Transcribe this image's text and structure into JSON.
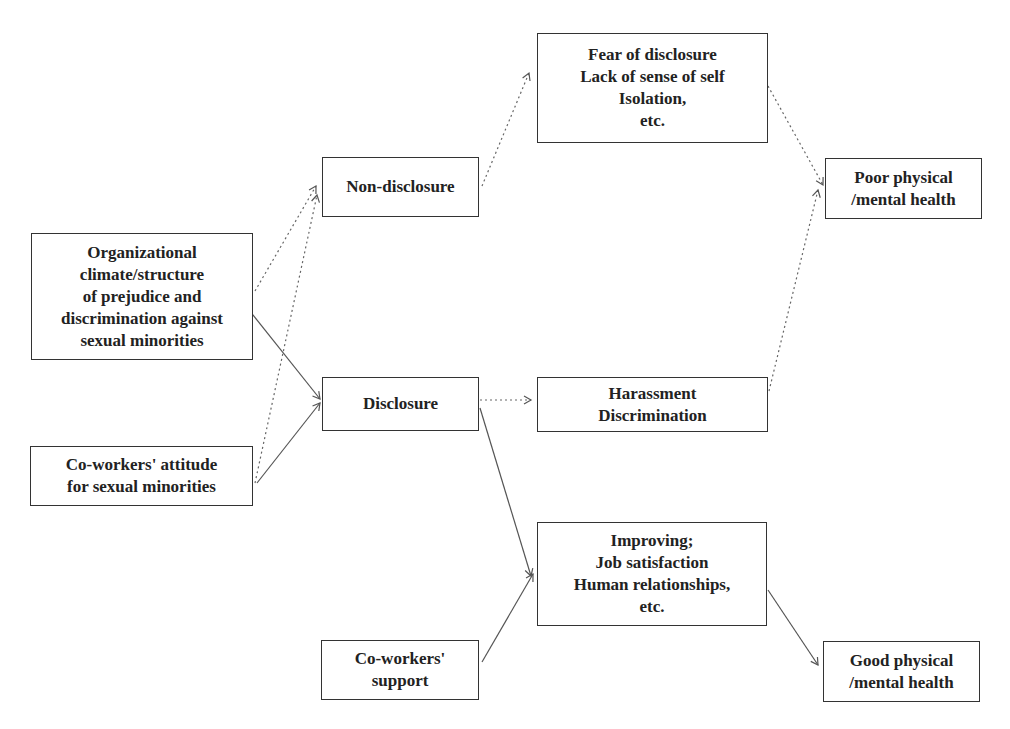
{
  "diagram": {
    "nodes": {
      "org_climate": {
        "lines": [
          "Organizational",
          "climate/structure",
          "of prejudice and",
          "discrimination against",
          "sexual minorities"
        ]
      },
      "coworkers_attitude": {
        "lines": [
          "Co-workers' attitude",
          "for sexual minorities"
        ]
      },
      "non_disclosure": {
        "lines": [
          "Non-disclosure"
        ]
      },
      "disclosure": {
        "lines": [
          "Disclosure"
        ]
      },
      "coworkers_support": {
        "lines": [
          "Co-workers'",
          "support"
        ]
      },
      "fear": {
        "lines": [
          "Fear of disclosure",
          "Lack of sense of self",
          "Isolation,",
          "etc."
        ]
      },
      "harassment": {
        "lines": [
          "Harassment",
          "Discrimination"
        ]
      },
      "improving": {
        "lines": [
          "Improving;",
          "Job satisfaction",
          "Human relationships,",
          "etc."
        ]
      },
      "poor_health": {
        "lines": [
          "Poor physical",
          "/mental health"
        ]
      },
      "good_health": {
        "lines": [
          "Good physical",
          "/mental health"
        ]
      }
    },
    "edges": [
      {
        "from": "org_climate",
        "to": "non_disclosure",
        "style": "dotted"
      },
      {
        "from": "org_climate",
        "to": "disclosure",
        "style": "solid"
      },
      {
        "from": "coworkers_attitude",
        "to": "non_disclosure",
        "style": "dotted"
      },
      {
        "from": "coworkers_attitude",
        "to": "disclosure",
        "style": "solid"
      },
      {
        "from": "non_disclosure",
        "to": "fear",
        "style": "dotted"
      },
      {
        "from": "disclosure",
        "to": "harassment",
        "style": "dotted"
      },
      {
        "from": "disclosure",
        "to": "improving",
        "style": "solid"
      },
      {
        "from": "coworkers_support",
        "to": "improving",
        "style": "solid"
      },
      {
        "from": "fear",
        "to": "poor_health",
        "style": "dotted"
      },
      {
        "from": "harassment",
        "to": "poor_health",
        "style": "dotted"
      },
      {
        "from": "improving",
        "to": "good_health",
        "style": "solid"
      }
    ],
    "colors": {
      "border": "#333333",
      "text": "#222222",
      "arrow": "#555555",
      "background": "#ffffff"
    }
  }
}
